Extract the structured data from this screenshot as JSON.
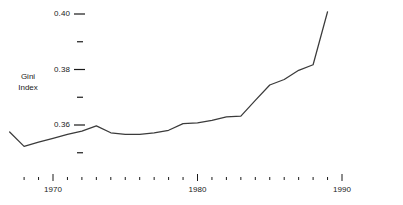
{
  "chart_data": {
    "type": "line",
    "title": "",
    "subtitle": "",
    "xlabel": "",
    "ylabel": "Gini Index",
    "ylabel_lines": [
      "Gini",
      "Index"
    ],
    "xlim": [
      1966.5,
      1990.5
    ],
    "ylim": [
      0.3475,
      0.4025
    ],
    "grid": false,
    "legend": null,
    "y_ticks_major": [
      0.36,
      0.38,
      0.4
    ],
    "y_tick_labels": [
      "0.36",
      "0.38",
      "0.40"
    ],
    "y_ticks_minor": [
      0.35,
      0.37,
      0.39
    ],
    "x_ticks_major": [
      1970,
      1980,
      1990
    ],
    "x_tick_labels": [
      "1970",
      "1980",
      "1990"
    ],
    "x_ticks_minor": [
      1968,
      1969,
      1971,
      1972,
      1973,
      1974,
      1975,
      1976,
      1977,
      1978,
      1979,
      1981,
      1982,
      1983,
      1984,
      1985,
      1986,
      1987,
      1988,
      1989
    ],
    "x": [
      1967,
      1968,
      1969,
      1970,
      1971,
      1972,
      1973,
      1974,
      1975,
      1976,
      1977,
      1978,
      1979,
      1980,
      1981,
      1982,
      1983,
      1984,
      1985,
      1986,
      1987,
      1988,
      1989
    ],
    "values": [
      0.3575,
      0.3523,
      0.3538,
      0.3552,
      0.3566,
      0.3578,
      0.3597,
      0.3572,
      0.3566,
      0.3566,
      0.3572,
      0.3581,
      0.3605,
      0.3608,
      0.3617,
      0.3629,
      0.3632,
      0.3689,
      0.3744,
      0.3764,
      0.3797,
      0.3817,
      0.4008
    ],
    "series": [
      {
        "name": "Gini Index",
        "color": "#3b3b3b",
        "values": [
          0.3575,
          0.3523,
          0.3538,
          0.3552,
          0.3566,
          0.3578,
          0.3597,
          0.3572,
          0.3566,
          0.3566,
          0.3572,
          0.3581,
          0.3605,
          0.3608,
          0.3617,
          0.3629,
          0.3632,
          0.3689,
          0.3744,
          0.3764,
          0.3797,
          0.3817,
          0.4008
        ]
      }
    ],
    "line_color": "#3b3b3b",
    "background_color": "#ffffff",
    "text_color": "#1a1a1a"
  }
}
